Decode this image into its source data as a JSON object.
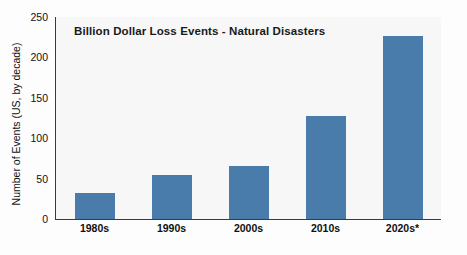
{
  "chart_data": {
    "type": "bar",
    "title": "Billion Dollar Loss Events - Natural Disasters",
    "categories": [
      "1980s",
      "1990s",
      "2000s",
      "2010s",
      "2020s*"
    ],
    "values": [
      32,
      55,
      65,
      128,
      227
    ],
    "xlabel": "",
    "ylabel": "Number of Events (US, by decade)",
    "ylim": [
      0,
      250
    ],
    "yticks": [
      0,
      50,
      100,
      150,
      200,
      250
    ],
    "ytick_labels": [
      "0",
      "50",
      "100",
      "150",
      "200",
      "250"
    ],
    "grid": false,
    "legend": null,
    "series_color": "#4a7cab",
    "plot_background": "#f7f7f7",
    "axis_color": "#3a3a3a"
  }
}
